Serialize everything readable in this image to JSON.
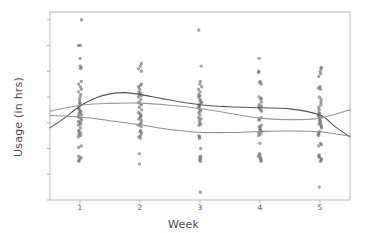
{
  "chart_data": {
    "type": "scatter",
    "title": "",
    "xlabel": "Week",
    "ylabel": "Usage (in hrs)",
    "xticks": [
      "1",
      "2",
      "3",
      "4",
      "5"
    ],
    "yticks": [
      "0",
      "10",
      "20",
      "30",
      "40",
      "50",
      "60",
      "70"
    ],
    "xlim": [
      0.5,
      5.5
    ],
    "ylim": [
      0,
      73
    ],
    "grid": false,
    "legend": "none",
    "marker_color": "#6b6b6b",
    "series": [
      {
        "name": "Week 1",
        "x": 1,
        "values": [
          70,
          60,
          60,
          55,
          52,
          51.5,
          51,
          46,
          45,
          44,
          43,
          42,
          41,
          40,
          39,
          38,
          37.5,
          37,
          36,
          35.5,
          35,
          34.5,
          34,
          33.5,
          33,
          32.5,
          32,
          31.5,
          31,
          30.5,
          30,
          29.5,
          29,
          28,
          27,
          26.5,
          26,
          25.5,
          25,
          24.5,
          21,
          20.5,
          17,
          16.5,
          16,
          15.5,
          15
        ]
      },
      {
        "name": "Week 2",
        "x": 2,
        "values": [
          53,
          52,
          51,
          50,
          45,
          44.5,
          44,
          43,
          42,
          41.5,
          41,
          40.5,
          40,
          39,
          38,
          37.5,
          37,
          36,
          35,
          34,
          33.5,
          33,
          32.5,
          32,
          31.5,
          31,
          30,
          29.5,
          29,
          28.5,
          27,
          26.5,
          26,
          25,
          24.5,
          24,
          18,
          14
        ]
      },
      {
        "name": "Week 3",
        "x": 3,
        "values": [
          66,
          52,
          46,
          45,
          44,
          43,
          42,
          41,
          40.5,
          40,
          39,
          38.5,
          38,
          37.5,
          37,
          36.5,
          36,
          35.5,
          35,
          34.5,
          34,
          33,
          32,
          31.5,
          31,
          30,
          29.5,
          29,
          25,
          24.5,
          24,
          20,
          17,
          16.5,
          16,
          15.5,
          15,
          3
        ]
      },
      {
        "name": "Week 4",
        "x": 4,
        "values": [
          55,
          50,
          49.5,
          46,
          45.5,
          45,
          40,
          39.5,
          39,
          38,
          37,
          36.5,
          36,
          35.5,
          35,
          34.5,
          32,
          31.5,
          31,
          29,
          28.5,
          28,
          27.5,
          27,
          26.5,
          26,
          25.5,
          25,
          22,
          18,
          17.5,
          17,
          16.5,
          16,
          15.5,
          15
        ]
      },
      {
        "name": "Week 5",
        "x": 5,
        "values": [
          51.5,
          51,
          50,
          49,
          48,
          44,
          43.5,
          43,
          40,
          39,
          38,
          37,
          36,
          35,
          34,
          33.5,
          33,
          32.5,
          32,
          31.5,
          31,
          30.5,
          30,
          29.5,
          29,
          28.5,
          28,
          26.5,
          26,
          25.5,
          25,
          22,
          21.5,
          21,
          17.5,
          17,
          16.5,
          16,
          15.5,
          15,
          5
        ]
      }
    ],
    "trend_lines": [
      {
        "name": "dark-trend",
        "color": "#555555",
        "x": [
          0.5,
          0.75,
          1.0,
          1.25,
          1.5,
          1.75,
          2.0,
          2.5,
          3.0,
          3.5,
          4.0,
          4.5,
          5.0,
          5.25,
          5.5
        ],
        "y": [
          28.0,
          32.0,
          36.5,
          39.5,
          41.2,
          41.7,
          41.0,
          38.8,
          37.0,
          36.2,
          35.8,
          35.4,
          33.0,
          28.5,
          24.5
        ]
      },
      {
        "name": "mid-trend",
        "color": "#9a9a9a",
        "x": [
          0.5,
          1.0,
          1.5,
          2.0,
          2.5,
          3.0,
          3.5,
          4.0,
          4.5,
          5.0,
          5.5
        ],
        "y": [
          34.5,
          36.8,
          37.5,
          37.6,
          36.8,
          35.5,
          33.6,
          31.8,
          31.2,
          31.8,
          35.0
        ]
      },
      {
        "name": "light-trend",
        "color": "#8d8d8d",
        "x": [
          0.5,
          1.0,
          1.5,
          2.0,
          2.5,
          3.0,
          3.5,
          4.0,
          4.5,
          5.0,
          5.5
        ],
        "y": [
          32.8,
          32.2,
          30.8,
          29.2,
          27.4,
          26.3,
          26.2,
          26.6,
          26.8,
          26.5,
          24.8
        ]
      }
    ]
  }
}
